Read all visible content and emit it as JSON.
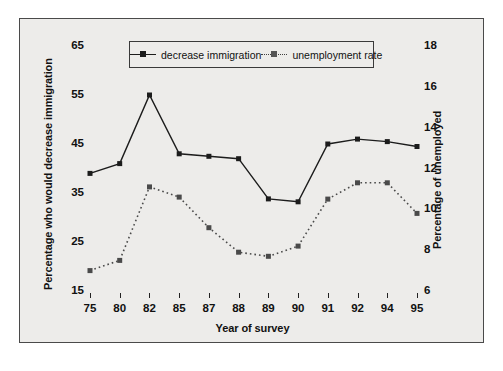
{
  "chart_data": {
    "type": "line",
    "title": "",
    "xlabel": "Year of survey",
    "ylabel": "Percentage who would decrease immigration",
    "y2label": "Percentage of unemployed",
    "categories": [
      "75",
      "80",
      "82",
      "85",
      "87",
      "88",
      "89",
      "90",
      "91",
      "92",
      "94",
      "95"
    ],
    "ylim": [
      15,
      65
    ],
    "yticks": [
      "65",
      "55",
      "45",
      "35",
      "25",
      "15"
    ],
    "y2lim": [
      6,
      18
    ],
    "y2ticks": [
      "18",
      "16",
      "14",
      "12",
      "10",
      "8",
      "6"
    ],
    "grid": false,
    "legend_position": "top-center",
    "series": [
      {
        "name": "decrease immigration",
        "axis": "left",
        "style": "solid",
        "marker": "square",
        "color": "#1c1c1c",
        "values": [
          39,
          41,
          55,
          43,
          42.5,
          42,
          33.8,
          33.2,
          45,
          46,
          45.5,
          44.5
        ]
      },
      {
        "name": "unemployment rate",
        "axis": "right",
        "style": "dotted",
        "marker": "square",
        "color": "#4a4a4a",
        "values": [
          7.0,
          7.5,
          11.1,
          10.6,
          9.1,
          7.9,
          7.7,
          8.2,
          10.5,
          11.3,
          11.3,
          9.8
        ]
      }
    ]
  },
  "legend": {
    "items": [
      {
        "label": "decrease immigration"
      },
      {
        "label": "unemployment rate"
      }
    ]
  },
  "colors": {
    "background": "#edecea",
    "frame": "#4a4a4a",
    "series1": "#1c1c1c",
    "series2": "#4a4a4a"
  }
}
